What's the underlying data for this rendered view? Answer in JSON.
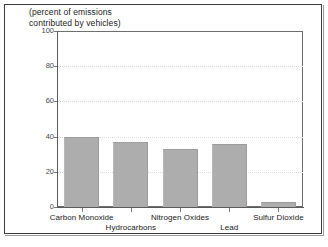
{
  "figure": {
    "caption": "(percent of emissions\ncontributed by vehicles)"
  },
  "chart_data": {
    "type": "bar",
    "title": "(percent of emissions contributed by vehicles)",
    "xlabel": "",
    "ylabel": "",
    "ylim": [
      0,
      100
    ],
    "yticks": [
      0,
      20,
      40,
      60,
      80,
      100
    ],
    "grid": true,
    "legend": "none",
    "categories": [
      "Carbon Monoxide",
      "Hydrocarbons",
      "Nitrogen Oxides",
      "Lead",
      "Sulfur Dioxide"
    ],
    "values": [
      40,
      37,
      33,
      36,
      3
    ],
    "bar_color": "#adadad"
  },
  "axis": {
    "y_tick_labels": [
      "0",
      "20",
      "40",
      "60",
      "80",
      "100"
    ],
    "x_tick_labels": [
      "Carbon Monoxide",
      "Hydrocarbons",
      "Nitrogen Oxides",
      "Lead",
      "Sulfur Dioxide"
    ]
  },
  "colors": {
    "bar": "#adadad",
    "axis": "#5a5a5a",
    "grid": "#dcdcdc",
    "frame": "#3c3c3c",
    "text": "#1a1a1a"
  }
}
